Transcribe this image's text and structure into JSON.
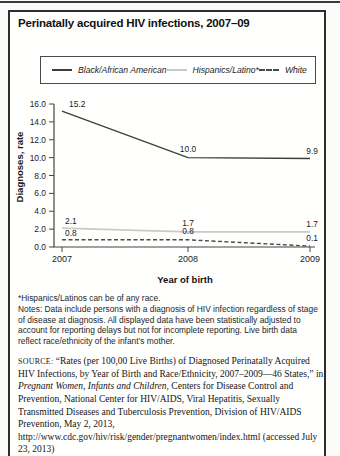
{
  "figure": {
    "title": "Perinatally acquired HIV infections, 2007–09"
  },
  "chart_data": {
    "type": "line",
    "x": [
      "2007",
      "2008",
      "2009"
    ],
    "xlabel": "Year of birth",
    "ylabel": "Diagnoses, rate",
    "ylim": [
      0,
      16
    ],
    "ytick_step": 2,
    "grid": false,
    "legend_position": "top",
    "series": [
      {
        "name": "Black/African American",
        "values": [
          15.2,
          10.0,
          9.9
        ],
        "color": "#3d3d3d",
        "dash": ""
      },
      {
        "name": "Hispanics/Latino*",
        "values": [
          2.1,
          1.7,
          1.7
        ],
        "color": "#c9c9c9",
        "dash": ""
      },
      {
        "name": "White",
        "values": [
          0.8,
          0.8,
          0.1
        ],
        "color": "#4a4a4a",
        "dash": "4 2.5"
      }
    ]
  },
  "footnotes": {
    "asterisk": "*Hispanics/Latinos can be of any race.",
    "notes": "Notes: Data include persons with a diagnosis of HIV infection regardless of stage of disease at diagnosis. All displayed data have been statistically adjusted to account for reporting delays but not for incomplete reporting. Live birth data reflect race/ethnicity of the infant’s mother."
  },
  "source": {
    "label": "SOURCE:",
    "part1": " “Rates (per 100,00 Live Births) of Diagnosed Perinatally Acquired HIV Infections, by Year of Birth and Race/Ethnicity, 2007–2009—46 States,” in ",
    "italic": "Pregnant Women, Infants and Children",
    "part2": ", Centers for Disease Control and Prevention, National Center for HIV/AIDS, Viral Hepatitis, Sexually Transmitted Diseases and Tuberculosis Prevention, Division of HIV/AIDS Prevention, May 2, 2013, http://www.cdc.gov/hiv/risk/gender/pregnantwomen/index.html (accessed July 23, 2013)"
  }
}
